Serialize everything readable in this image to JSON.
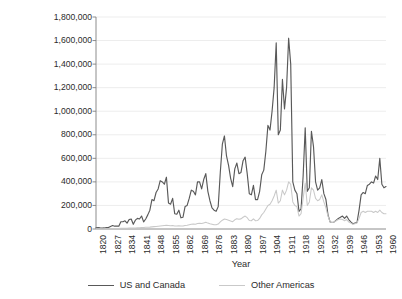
{
  "chart_data": {
    "type": "line",
    "title": "",
    "xlabel": "Year",
    "ylabel": "Settler migration",
    "xlim": [
      1820,
      1960
    ],
    "ylim": [
      0,
      1800000
    ],
    "grid": true,
    "legend_position": "bottom",
    "ytick_labels": [
      "0",
      "200,000",
      "400,000",
      "600,000",
      "800,000",
      "1,000,000",
      "1,200,000",
      "1,400,000",
      "1,600,000",
      "1,800,000"
    ],
    "ytick_values": [
      0,
      200000,
      400000,
      600000,
      800000,
      1000000,
      1200000,
      1400000,
      1600000,
      1800000
    ],
    "xtick_labels": [
      "1820",
      "1827",
      "1834",
      "1841",
      "1848",
      "1855",
      "1862",
      "1869",
      "1876",
      "1883",
      "1890",
      "1897",
      "1904",
      "1911",
      "1918",
      "1925",
      "1932",
      "1939",
      "1946",
      "1953",
      "1960"
    ],
    "xtick_values": [
      1820,
      1827,
      1834,
      1841,
      1848,
      1855,
      1862,
      1869,
      1876,
      1883,
      1890,
      1897,
      1904,
      1911,
      1918,
      1925,
      1932,
      1939,
      1946,
      1953,
      1960
    ],
    "colors": {
      "us_and_canada": "#595959",
      "other_americas": "#c9c9c9",
      "grid": "#ededed",
      "axis": "#808080",
      "text": "#2b2b2b"
    },
    "x": [
      1820,
      1821,
      1822,
      1823,
      1824,
      1825,
      1826,
      1827,
      1828,
      1829,
      1830,
      1831,
      1832,
      1833,
      1834,
      1835,
      1836,
      1837,
      1838,
      1839,
      1840,
      1841,
      1842,
      1843,
      1844,
      1845,
      1846,
      1847,
      1848,
      1849,
      1850,
      1851,
      1852,
      1853,
      1854,
      1855,
      1856,
      1857,
      1858,
      1859,
      1860,
      1861,
      1862,
      1863,
      1864,
      1865,
      1866,
      1867,
      1868,
      1869,
      1870,
      1871,
      1872,
      1873,
      1874,
      1875,
      1876,
      1877,
      1878,
      1879,
      1880,
      1881,
      1882,
      1883,
      1884,
      1885,
      1886,
      1887,
      1888,
      1889,
      1890,
      1891,
      1892,
      1893,
      1894,
      1895,
      1896,
      1897,
      1898,
      1899,
      1900,
      1901,
      1902,
      1903,
      1904,
      1905,
      1906,
      1907,
      1908,
      1909,
      1910,
      1911,
      1912,
      1913,
      1914,
      1915,
      1916,
      1917,
      1918,
      1919,
      1920,
      1921,
      1922,
      1923,
      1924,
      1925,
      1926,
      1927,
      1928,
      1929,
      1930,
      1931,
      1932,
      1933,
      1934,
      1935,
      1936,
      1937,
      1938,
      1939,
      1940,
      1941,
      1942,
      1943,
      1944,
      1945,
      1946,
      1947,
      1948,
      1949,
      1950,
      1951,
      1952,
      1953,
      1954,
      1955,
      1956,
      1957,
      1958,
      1959,
      1960
    ],
    "series": [
      {
        "name": "US and Canada",
        "color": "#595959",
        "values": [
          10000,
          12000,
          9000,
          8000,
          9000,
          13000,
          12000,
          22000,
          30000,
          24000,
          25000,
          24000,
          62000,
          62000,
          70000,
          50000,
          80000,
          85000,
          40000,
          75000,
          90000,
          85000,
          110000,
          60000,
          85000,
          120000,
          160000,
          250000,
          240000,
          310000,
          340000,
          410000,
          400000,
          380000,
          440000,
          220000,
          210000,
          260000,
          130000,
          125000,
          160000,
          95000,
          100000,
          190000,
          200000,
          260000,
          330000,
          320000,
          290000,
          400000,
          400000,
          340000,
          420000,
          470000,
          320000,
          240000,
          180000,
          160000,
          150000,
          190000,
          480000,
          720000,
          790000,
          620000,
          540000,
          430000,
          360000,
          510000,
          560000,
          470000,
          480000,
          580000,
          610000,
          470000,
          300000,
          290000,
          370000,
          250000,
          250000,
          320000,
          460000,
          500000,
          660000,
          880000,
          840000,
          1000000,
          1200000,
          1580000,
          800000,
          840000,
          1270000,
          1020000,
          1200000,
          1620000,
          1400000,
          400000,
          330000,
          300000,
          150000,
          170000,
          450000,
          860000,
          320000,
          350000,
          830000,
          700000,
          400000,
          330000,
          350000,
          420000,
          300000,
          250000,
          120000,
          60000,
          55000,
          60000,
          75000,
          90000,
          100000,
          110000,
          90000,
          110000,
          80000,
          60000,
          45000,
          50000,
          55000,
          160000,
          290000,
          310000,
          300000,
          370000,
          380000,
          400000,
          390000,
          450000,
          420000,
          600000,
          380000,
          350000,
          360000
        ]
      },
      {
        "name": "Other Americas",
        "color": "#c9c9c9",
        "values": [
          2000,
          2000,
          2000,
          2000,
          2000,
          3000,
          3000,
          3000,
          4000,
          4000,
          5000,
          5000,
          6000,
          6000,
          7000,
          7000,
          8000,
          8000,
          9000,
          9000,
          10000,
          10000,
          12000,
          12000,
          14000,
          15000,
          16000,
          18000,
          20000,
          22000,
          24000,
          26000,
          28000,
          30000,
          32000,
          30000,
          28000,
          30000,
          26000,
          26000,
          28000,
          26000,
          26000,
          30000,
          32000,
          36000,
          40000,
          42000,
          40000,
          46000,
          48000,
          46000,
          52000,
          58000,
          50000,
          44000,
          40000,
          36000,
          36000,
          42000,
          60000,
          75000,
          85000,
          80000,
          75000,
          68000,
          62000,
          78000,
          88000,
          82000,
          86000,
          100000,
          110000,
          96000,
          72000,
          70000,
          86000,
          70000,
          72000,
          90000,
          120000,
          140000,
          170000,
          200000,
          210000,
          240000,
          280000,
          330000,
          220000,
          240000,
          330000,
          290000,
          330000,
          400000,
          380000,
          230000,
          200000,
          190000,
          110000,
          130000,
          260000,
          390000,
          200000,
          230000,
          350000,
          330000,
          260000,
          240000,
          250000,
          290000,
          230000,
          180000,
          110000,
          60000,
          55000,
          60000,
          70000,
          80000,
          85000,
          80000,
          70000,
          80000,
          60000,
          50000,
          40000,
          45000,
          50000,
          90000,
          140000,
          150000,
          140000,
          150000,
          150000,
          150000,
          140000,
          150000,
          140000,
          160000,
          140000,
          130000,
          130000
        ]
      }
    ]
  },
  "legend": {
    "items": [
      {
        "label": "US and Canada",
        "color": "#595959"
      },
      {
        "label": "Other Americas",
        "color": "#c9c9c9"
      }
    ]
  },
  "axes": {
    "x_title": "Year",
    "y_title": "Settler migration"
  }
}
